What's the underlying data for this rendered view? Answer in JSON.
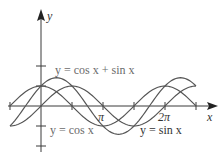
{
  "chart_data": {
    "type": "line",
    "title": "",
    "xlabel": "x",
    "ylabel": "y",
    "xlim": [
      -1.5708,
      7.854
    ],
    "ylim": [
      -2,
      3
    ],
    "x_ticks": [
      {
        "value": -1.5708,
        "label": ""
      },
      {
        "value": 1.5708,
        "label": ""
      },
      {
        "value": 3.1416,
        "label": "π"
      },
      {
        "value": 4.7124,
        "label": ""
      },
      {
        "value": 6.2832,
        "label": "2π"
      },
      {
        "value": 7.854,
        "label": ""
      }
    ],
    "y_ticks": [
      -2,
      -1,
      1,
      2
    ],
    "grid": false,
    "series": [
      {
        "name": "y = cos x",
        "function": "cos",
        "domain": [
          -1.5708,
          7.854
        ]
      },
      {
        "name": "y = sin x",
        "function": "sin",
        "domain": [
          -1.5708,
          7.854
        ]
      },
      {
        "name": "y = cos x + sin x",
        "function": "cos+sin",
        "domain": [
          -1.5708,
          7.854
        ]
      }
    ],
    "annotations": [
      {
        "text": "y = cos x + sin x",
        "target": "cos+sin"
      },
      {
        "text": "y = cos x",
        "target": "cos"
      },
      {
        "text": "y = sin x",
        "target": "sin"
      }
    ]
  },
  "labels": {
    "x_axis": "x",
    "y_axis": "y",
    "pi": "π",
    "two_pi": "2π",
    "sum_curve": "y = cos x + sin x",
    "cos_curve": "y = cos x",
    "sin_curve": "y = sin x"
  }
}
